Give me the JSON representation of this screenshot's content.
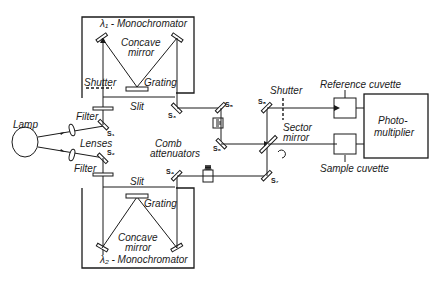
{
  "diagram": {
    "labels": {
      "mono1": "λ₁ - Monochromator",
      "mono2": "λ₂ - Monochromator",
      "concave_mirror_top": "Concave",
      "concave_mirror_top2": "mirror",
      "concave_mirror_bot": "Concave",
      "concave_mirror_bot2": "mirror",
      "grating_top": "Grating",
      "grating_bot": "Grating",
      "shutter_left": "Shutter",
      "shutter_right": "Shutter",
      "slit_top": "Slit",
      "slit_bot": "Slit",
      "filter_top": "Filter",
      "filter_bot": "Filter",
      "lamp": "Lamp",
      "lenses": "Lenses",
      "comb1": "Comb",
      "comb2": "attenuators",
      "sector1": "Sector",
      "sector2": "mirror",
      "reference_cuvette": "Reference cuvette",
      "sample_cuvette": "Sample cuvette",
      "photo1": "Photo-",
      "photo2": "multiplier"
    },
    "mirrors": {
      "s1": "S₁",
      "s2": "S₂",
      "s3": "S₃",
      "s4": "S₄",
      "s5": "S₅",
      "s6": "S₆",
      "s7": "S₇",
      "s8": "S₈"
    },
    "colors": {
      "ink": "#1a1a1a",
      "background": "#ffffff"
    }
  }
}
